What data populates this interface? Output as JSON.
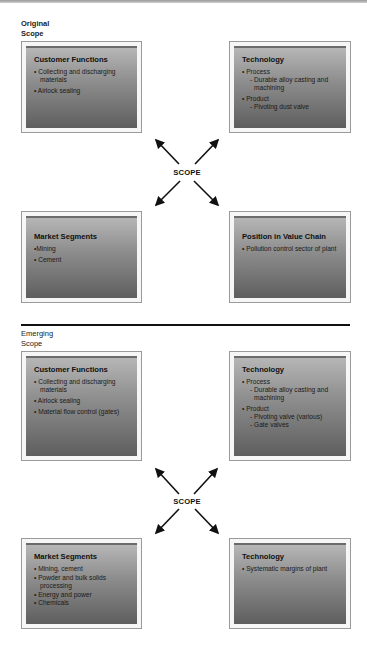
{
  "original": {
    "label_line1": "Original",
    "label_line2": "Scope",
    "center_label": "SCOPE",
    "boxes": {
      "top_left": {
        "title": "Customer Functions",
        "items": [
          "• Collecting and discharging materials",
          "• Airlock sealing"
        ]
      },
      "top_right": {
        "title": "Technology",
        "items": [
          {
            "text": "• Process",
            "subs": [
              "- Durable alloy casting and machining"
            ]
          },
          {
            "text": "• Product",
            "subs": [
              "- Pivoting dust valve"
            ]
          }
        ]
      },
      "bottom_left": {
        "title": "Market Segments",
        "items": [
          "•Mining",
          "• Cement"
        ]
      },
      "bottom_right": {
        "title": "Position in Value Chain",
        "items": [
          "• Pollution control sector of plant"
        ]
      }
    }
  },
  "emerging": {
    "label_line1": "Emerging",
    "label_line2": "Scope",
    "center_label": "SCOPE",
    "boxes": {
      "top_left": {
        "title": "Customer Functions",
        "items": [
          "• Collecting and discharging materials",
          "• Airlock sealing",
          "• Material flow control (gates)"
        ]
      },
      "top_right": {
        "title": "Technology",
        "items": [
          {
            "text": "• Process",
            "subs": [
              "- Durable alloy casting and machining"
            ]
          },
          {
            "text": "• Product",
            "subs": [
              "- Pivoting valve (various)",
              "- Gate valves"
            ]
          }
        ]
      },
      "bottom_left": {
        "title": "Market Segments",
        "items": [
          "• Mining, cement",
          "• Powder and bulk solids processing",
          "• Energy and power",
          "• Chemicals"
        ]
      },
      "bottom_right": {
        "title": "Technology",
        "items": [
          "• Systematic margins of plant"
        ]
      }
    }
  },
  "colors": {
    "box_gradient_top": "#b6b6b6",
    "box_gradient_bottom": "#5e5e5e",
    "arrow": "#111111",
    "divider": "#111111"
  }
}
